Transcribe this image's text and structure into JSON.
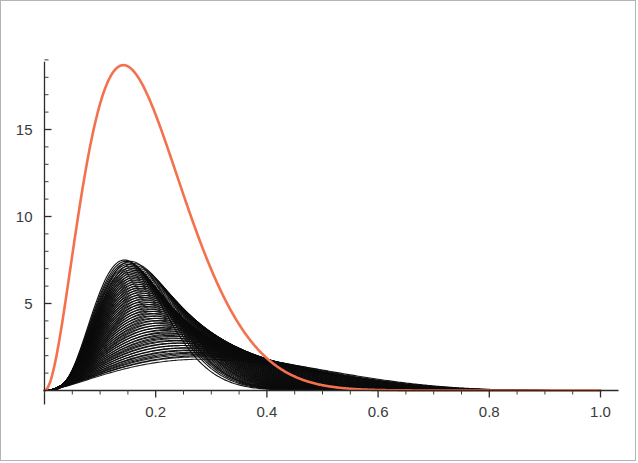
{
  "figure": {
    "background_color": "#ffffff",
    "frame_color": "#b4b4b4",
    "width": 638,
    "height": 463
  },
  "chart_data": {
    "type": "line",
    "title": "",
    "subtitle": "",
    "xlabel": "",
    "ylabel": "",
    "xlim": [
      0.0,
      1.0
    ],
    "ylim": [
      0.0,
      19.5
    ],
    "grid": false,
    "legend": "none",
    "axis_style": "mathematica-plain-axes",
    "x_ticks_major": [
      0.2,
      0.4,
      0.6,
      0.8,
      1.0
    ],
    "x_tick_labels": [
      "0.2",
      "0.4",
      "0.6",
      "0.8",
      "1.0"
    ],
    "x_tick_minor_step": 0.05,
    "y_ticks_major": [
      5,
      10,
      15
    ],
    "y_tick_labels": [
      "5",
      "10",
      "15"
    ],
    "y_tick_minor_step": 1,
    "annotations": [],
    "series": [
      {
        "name": "family-of-densities",
        "role": "background-family",
        "color": "#0b0b0b",
        "stroke_width": 1.15,
        "count": 44,
        "description": "Overlapping family of right-skewed unimodal density curves producing a dark moire envelope",
        "envelope_peak_x": 0.23,
        "envelope_peak_y": 7.5,
        "family_peak_x_range": [
          0.14,
          0.4
        ],
        "family_peak_y_range": [
          2.0,
          7.5
        ],
        "family_shape_a_range": [
          2.6,
          5.2
        ],
        "family_shape_b_range": [
          5.0,
          26.0
        ],
        "tail_end_x": 1.0,
        "tail_end_y": 1.15
      },
      {
        "name": "highlighted-density",
        "role": "foreground-highlight",
        "color": "#F4714E",
        "stroke_width": 2.6,
        "description": "Single sharply peaked right-skewed density drawn in orange over the family",
        "peak_x": 0.145,
        "peak_y": 18.7,
        "shape_a": 3.05,
        "shape_b": 13.4,
        "zero_crossing_x": 0.42,
        "points": [
          {
            "x": 0.0,
            "y": 0.0
          },
          {
            "x": 0.02,
            "y": 0.55
          },
          {
            "x": 0.04,
            "y": 3.0
          },
          {
            "x": 0.06,
            "y": 6.6
          },
          {
            "x": 0.08,
            "y": 10.4
          },
          {
            "x": 0.1,
            "y": 13.8
          },
          {
            "x": 0.12,
            "y": 16.5
          },
          {
            "x": 0.145,
            "y": 18.7
          },
          {
            "x": 0.17,
            "y": 18.3
          },
          {
            "x": 0.19,
            "y": 17.0
          },
          {
            "x": 0.21,
            "y": 15.0
          },
          {
            "x": 0.23,
            "y": 12.6
          },
          {
            "x": 0.25,
            "y": 10.2
          },
          {
            "x": 0.27,
            "y": 8.0
          },
          {
            "x": 0.29,
            "y": 6.1
          },
          {
            "x": 0.31,
            "y": 4.5
          },
          {
            "x": 0.33,
            "y": 3.2
          },
          {
            "x": 0.35,
            "y": 2.2
          },
          {
            "x": 0.38,
            "y": 1.1
          },
          {
            "x": 0.42,
            "y": 0.35
          },
          {
            "x": 0.5,
            "y": 0.04
          },
          {
            "x": 0.7,
            "y": 0.0
          },
          {
            "x": 1.0,
            "y": 0.0
          }
        ]
      }
    ]
  }
}
